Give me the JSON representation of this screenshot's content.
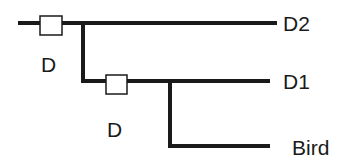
{
  "diagram": {
    "type": "phylogenetic-tree",
    "leaves": [
      {
        "label": "D2"
      },
      {
        "label": "D1"
      },
      {
        "label": "Bird"
      }
    ],
    "events": [
      {
        "label": "D",
        "position": "root-branch"
      },
      {
        "label": "D",
        "position": "internal-branch"
      }
    ],
    "colors": {
      "line": "#1a1a1a",
      "box_fill": "#ffffff",
      "background": "#ffffff"
    }
  }
}
